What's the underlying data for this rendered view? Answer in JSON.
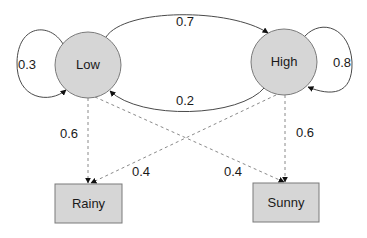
{
  "diagram": {
    "type": "hidden-markov-model",
    "hidden_states": [
      {
        "id": "low",
        "label": "Low"
      },
      {
        "id": "high",
        "label": "High"
      }
    ],
    "observations": [
      {
        "id": "rainy",
        "label": "Rainy"
      },
      {
        "id": "sunny",
        "label": "Sunny"
      }
    ],
    "transitions": [
      {
        "from": "low",
        "to": "low",
        "label": "0.3"
      },
      {
        "from": "low",
        "to": "high",
        "label": "0.7"
      },
      {
        "from": "high",
        "to": "low",
        "label": "0.2"
      },
      {
        "from": "high",
        "to": "high",
        "label": "0.8"
      }
    ],
    "emissions": [
      {
        "from": "low",
        "to": "rainy",
        "label": "0.6"
      },
      {
        "from": "low",
        "to": "sunny",
        "label": "0.4"
      },
      {
        "from": "high",
        "to": "rainy",
        "label": "0.4"
      },
      {
        "from": "high",
        "to": "sunny",
        "label": "0.6"
      }
    ]
  }
}
